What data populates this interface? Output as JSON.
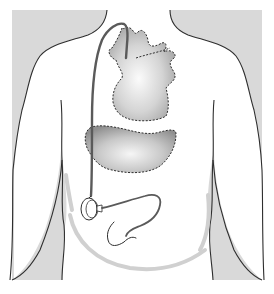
{
  "figure": {
    "colors": {
      "background": "#ffffff",
      "backdrop": "#d9d9d9",
      "outline": "#2e2e2e",
      "organ_light": "#f4f4f4",
      "organ_dark": "#9a9a9a",
      "catheter": "#5a5a5a",
      "skin_shadow": "#d0d0d0"
    },
    "elements": [
      "body-silhouette",
      "heart",
      "liver",
      "catheter-line",
      "port-device",
      "catheter-tail"
    ]
  }
}
